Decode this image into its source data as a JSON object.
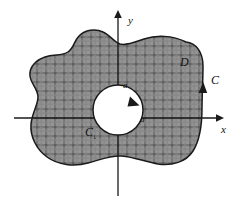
{
  "figure": {
    "background_color": "#ffffff",
    "stroke_color": "#1a1a1a",
    "fill_color": "#8b8b8b",
    "hatch_color": "#6e6e6e",
    "inner_hole_color": "#ffffff"
  },
  "axes": {
    "x_label": "x",
    "y_label": "y",
    "origin": {
      "x": 118,
      "y": 118
    },
    "x_axis_from": {
      "x": 14,
      "y": 118
    },
    "x_axis_to": {
      "x": 222,
      "y": 118
    },
    "y_axis_from": {
      "x": 118,
      "y": 196
    },
    "y_axis_to": {
      "x": 118,
      "y": 10
    },
    "arrowheads": [
      "x-positive",
      "y-positive"
    ]
  },
  "labels": {
    "region": "D",
    "outer_curve": "C",
    "inner_curve": "C",
    "inner_curve_subscript": "1",
    "radius_top": "a",
    "radius_right": "a"
  },
  "geometry": {
    "inner_circle": {
      "cx": 118,
      "cy": 110,
      "r": 25
    },
    "outer_curve_orientation": "counterclockwise",
    "inner_curve_orientation": "clockwise",
    "outer_arrow_direction": "up",
    "inner_arrow_direction": "down-right"
  }
}
